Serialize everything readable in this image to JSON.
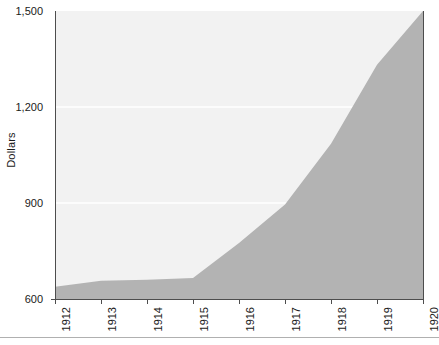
{
  "chart_data": {
    "type": "area",
    "title": "",
    "xlabel": "",
    "ylabel": "Dollars",
    "categories": [
      "1912",
      "1913",
      "1914",
      "1915",
      "1916",
      "1917",
      "1918",
      "1919",
      "1920"
    ],
    "x": [
      1912,
      1913,
      1914,
      1915,
      1916,
      1917,
      1918,
      1919,
      1920
    ],
    "values": [
      638,
      657,
      660,
      666,
      775,
      895,
      1085,
      1332,
      1500
    ],
    "series": [
      {
        "name": "Dollars",
        "values": [
          638,
          657,
          660,
          666,
          775,
          895,
          1085,
          1332,
          1500
        ]
      }
    ],
    "ylim": [
      600,
      1500
    ],
    "xlim": [
      1912,
      1920
    ],
    "yticks": [
      600,
      900,
      1200,
      1500
    ],
    "ytick_labels": [
      "600",
      "900",
      "1,200",
      "1,500"
    ],
    "xtick_labels": [
      "1912",
      "1913",
      "1914",
      "1915",
      "1916",
      "1917",
      "1918",
      "1919",
      "1920"
    ],
    "grid": true,
    "grid_axis": "y",
    "legend": false,
    "legend_position": "none",
    "colors": {
      "area_fill": "#b3b3b3",
      "plot_background": "#f2f2f2",
      "gridline": "#ffffff",
      "axis": "#4d4d4d",
      "text": "#1a1a1a",
      "page_background": "#ffffff",
      "bottom_rule": "#b0b0b0"
    }
  },
  "axes": {
    "y_title": "Dollars",
    "y_ticks": [
      {
        "label": "1,500",
        "value": 1500
      },
      {
        "label": "1,200",
        "value": 1200
      },
      {
        "label": "900",
        "value": 900
      },
      {
        "label": "600",
        "value": 600
      }
    ],
    "x_ticks": [
      {
        "label": "1912",
        "value": 1912
      },
      {
        "label": "1913",
        "value": 1913
      },
      {
        "label": "1914",
        "value": 1914
      },
      {
        "label": "1915",
        "value": 1915
      },
      {
        "label": "1916",
        "value": 1916
      },
      {
        "label": "1917",
        "value": 1917
      },
      {
        "label": "1918",
        "value": 1918
      },
      {
        "label": "1919",
        "value": 1919
      },
      {
        "label": "1920",
        "value": 1920
      }
    ]
  }
}
